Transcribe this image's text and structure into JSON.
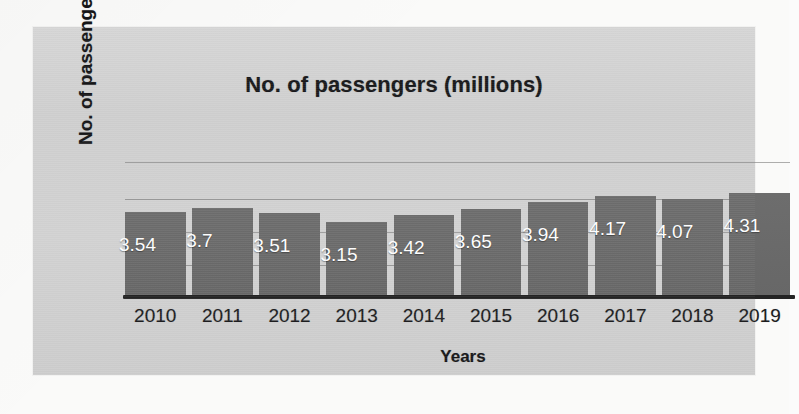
{
  "chart_data": {
    "type": "bar",
    "title": "No. of passengers (millions)",
    "xlabel": "Years",
    "ylabel": "No. of passengers",
    "categories": [
      "2010",
      "2011",
      "2012",
      "2013",
      "2014",
      "2015",
      "2016",
      "2017",
      "2018",
      "2019"
    ],
    "values": [
      3.54,
      3.7,
      3.51,
      3.15,
      3.42,
      3.65,
      3.94,
      4.17,
      4.07,
      4.31
    ],
    "data_labels": [
      "3.54",
      "3.7",
      "3.51",
      "3.15",
      "3.42",
      "3.65",
      "3.94",
      "4.17",
      "4.07",
      "4.31"
    ],
    "ylim": [
      0,
      5.0
    ],
    "grid": true,
    "gridlines_y": [
      2.6,
      3.2,
      3.7,
      4.25
    ],
    "legend": null,
    "legend_position": "none",
    "series": [
      {
        "name": "No. of passengers (millions)",
        "values": [
          3.54,
          3.7,
          3.51,
          3.15,
          3.42,
          3.65,
          3.94,
          4.17,
          4.07,
          4.31
        ]
      }
    ],
    "colors": {
      "bar": "#6a6a6a",
      "data_label_text": "#ffffff",
      "axis_line": "#242424",
      "gridline": "#6e6e6e",
      "panel_background": "#d2d2d2",
      "page_background": "#fafaf9",
      "title_text": "#18181a"
    }
  }
}
